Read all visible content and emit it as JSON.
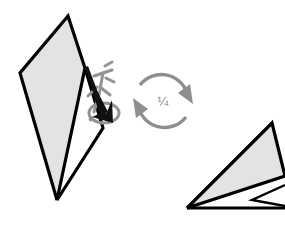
{
  "figure": {
    "kind": "origami-instruction-diagram",
    "background_color": "#ffffff",
    "width": 285,
    "height": 226
  },
  "palette": {
    "paper_fill": "#e3e3e3",
    "paper_white": "#ffffff",
    "outline": "#000000",
    "hint_gray": "#949494",
    "rotate_gray": "#8e8e8e",
    "label_gray": "#8a8a8a"
  },
  "rotation_symbol": {
    "name": "quarter-turn-rotate-symbol",
    "label": "¼",
    "arrow_count": 2,
    "direction": "clockwise",
    "color": "#8e8e8e",
    "center_x": 163,
    "center_y": 101,
    "radius": 27
  },
  "shapes": {
    "left_model": {
      "name": "left-folded-model",
      "description": "tall narrow kite with a thin V sliver at its lower point",
      "fill": "#e3e3e3",
      "outline": "#000000",
      "outline_width": 3.2,
      "main_points": "68,16 20,73 57,200 85,68",
      "sliver_points": "85,68 103,128 57,200"
    },
    "right_model": {
      "name": "right-folded-model",
      "description": "flat elongated triangle resting on a horizontal base, rotated one quarter turn",
      "fill": "#e3e3e3",
      "outline": "#000000",
      "outline_width": 3.2,
      "main_points": "272,123 285,178 187,208",
      "base_points": "187,208 285,208 285,192",
      "notch_points": "250,200 285,185 285,208"
    }
  },
  "annotations": {
    "fold_arrow": {
      "name": "fold-arrow",
      "color": "#111111",
      "description": "solid black arrow pointing down-left toward the fold point",
      "tail_x": 86,
      "tail_y": 70,
      "head_x": 97,
      "head_y": 122
    },
    "push_hint": {
      "name": "push-in-hint-arrow",
      "color": "#949494",
      "description": "gray hollow push arrow behind the black fold arrow"
    },
    "tuck_loop": {
      "name": "tuck-loop-hint",
      "color": "#949494",
      "description": "gray oval loop indicating tuck/rotate under"
    },
    "reference_dot": {
      "name": "reference-point-dot",
      "color": "#8f8f8f",
      "x": 91,
      "y": 119,
      "r": 2.4
    }
  }
}
